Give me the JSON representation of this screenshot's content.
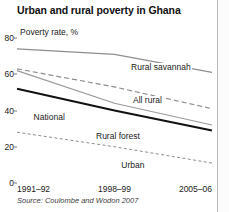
{
  "figure": {
    "marker": "",
    "title": "Urban and rural poverty in Ghana",
    "source": "Source: Coulombe and Wodon 2007"
  },
  "chart_data": {
    "type": "line",
    "title": "Urban and rural poverty in Ghana",
    "xlabel": "",
    "ylabel": "Poverty rate, %",
    "ylim": [
      0,
      80
    ],
    "yticks": [
      0,
      20,
      40,
      60,
      80
    ],
    "grid": false,
    "legend": "inline-labels",
    "categories": [
      "1991–92",
      "1998–99",
      "2005–06"
    ],
    "series": [
      {
        "name": "Rural savannah",
        "values": [
          74,
          71,
          61
        ],
        "style": "solid",
        "color": "#8e8e8e",
        "width": 1.3,
        "label_x_pct": 58,
        "label_y_pct": 17
      },
      {
        "name": "All rural",
        "values": [
          63,
          53,
          41
        ],
        "style": "dashed",
        "color": "#8e8e8e",
        "width": 1.2,
        "label_x_pct": 59,
        "label_y_pct": 40
      },
      {
        "name": "Rural forest",
        "values": [
          62,
          44,
          32
        ],
        "style": "solid",
        "color": "#9a9a9a",
        "width": 1.2,
        "label_x_pct": 40,
        "label_y_pct": 65
      },
      {
        "name": "National",
        "values": [
          52,
          40,
          29
        ],
        "style": "solid",
        "color": "#111111",
        "width": 2.0,
        "label_x_pct": 8,
        "label_y_pct": 52
      },
      {
        "name": "Urban",
        "values": [
          28,
          20,
          11
        ],
        "style": "dashed-fine",
        "color": "#8e8e8e",
        "width": 1.0,
        "label_x_pct": 53,
        "label_y_pct": 85
      }
    ]
  }
}
